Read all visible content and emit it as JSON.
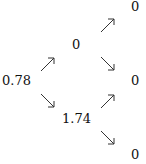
{
  "tree": {
    "root": {
      "value": "0.78"
    },
    "level1": [
      {
        "value": "0"
      },
      {
        "value": "1.74"
      }
    ],
    "level2": [
      {
        "value": "0"
      },
      {
        "value": "0"
      },
      {
        "value": "0"
      }
    ],
    "arrow_color": "#333333"
  }
}
